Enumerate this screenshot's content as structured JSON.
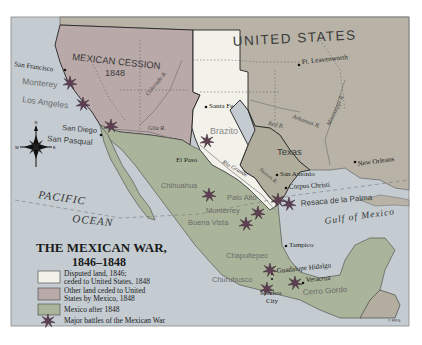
{
  "map": {
    "title_line1": "THE MEXICAN WAR,",
    "title_line2": "1846–1848",
    "colors": {
      "ocean": "#c4ccd2",
      "united_states": "#b8b3a6",
      "mexican_cession": "#b9a9a8",
      "disputed_land": "#f2f1ea",
      "mexico": "#aab49a",
      "central_america": "#b3ae9f",
      "battle_star": "#6a4a5a",
      "border": "#2a2a2a"
    },
    "regions": {
      "united_states": "UNITED STATES",
      "mexican_cession": "MEXICAN CESSION",
      "mexican_cession_year": "1848",
      "texas": "Texas",
      "brazito": "Brazito"
    },
    "water": {
      "pacific": "PACIFIC",
      "ocean": "OCEAN",
      "gulf": "Gulf of Mexico"
    },
    "rivers": {
      "colorado": "Colorado R.",
      "gila": "Gila R.",
      "arkansas": "Arkansas R.",
      "mississippi": "Mississippi R.",
      "red": "Red R.",
      "rio_grande": "Rio Grande",
      "nueces": "Nueces R."
    },
    "cities": [
      {
        "name": "San Francisco"
      },
      {
        "name": "Santa Fe"
      },
      {
        "name": "Ft. Leavenworth"
      },
      {
        "name": "El Paso"
      },
      {
        "name": "San Antonio"
      },
      {
        "name": "Corpus Christi"
      },
      {
        "name": "New Orleans"
      },
      {
        "name": "Tampico"
      },
      {
        "name": "Guadalupe Hidalgo"
      },
      {
        "name": "Veracruz"
      },
      {
        "name": "Mexico"
      },
      {
        "name": "City"
      },
      {
        "name": "San Diego"
      }
    ],
    "battles": [
      {
        "name": "Monterey"
      },
      {
        "name": "Los Angeles"
      },
      {
        "name": "San Pasqual"
      },
      {
        "name": "Chihuahua"
      },
      {
        "name": "Palo Alto"
      },
      {
        "name": "Monterrey"
      },
      {
        "name": "Buena Vista"
      },
      {
        "name": "Resaca de la Palma"
      },
      {
        "name": "Chapultepec"
      },
      {
        "name": "Churubusco"
      },
      {
        "name": "Cerro Gordo"
      }
    ],
    "compass": {
      "n": "N",
      "s": "S",
      "e": "E",
      "w": "W"
    },
    "copyright": "© FPG"
  },
  "legend": {
    "items": [
      {
        "line1": "Disputed land, 1846;",
        "line2": "ceded to United States, 1848"
      },
      {
        "line1": "Other land ceded to United",
        "line2": "States by Mexico, 1848"
      },
      {
        "line1": "Mexico after 1848",
        "line2": ""
      },
      {
        "line1": "Major battles of the Mexican War",
        "line2": ""
      }
    ]
  }
}
